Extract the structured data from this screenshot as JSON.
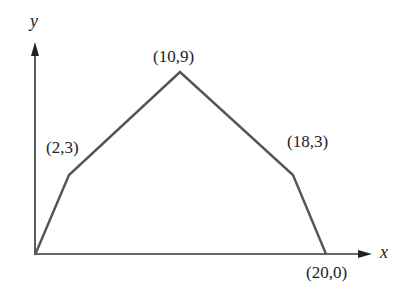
{
  "diagram": {
    "type": "polygonal-path",
    "axes": {
      "x_label": "x",
      "y_label": "y"
    },
    "points": [
      {
        "label": "(0,0)",
        "x": 0,
        "y": 0,
        "labeled": false
      },
      {
        "label": "(2,3)",
        "x": 2,
        "y": 3,
        "labeled": true
      },
      {
        "label": "(10,9)",
        "x": 10,
        "y": 9,
        "labeled": true
      },
      {
        "label": "(18,3)",
        "x": 18,
        "y": 3,
        "labeled": true
      },
      {
        "label": "(20,0)",
        "x": 20,
        "y": 0,
        "labeled": true
      }
    ],
    "labels": {
      "p1": "(2,3)",
      "p2": "(10,9)",
      "p3": "(18,3)",
      "p4": "(20,0)"
    },
    "colors": {
      "path": "#555555",
      "axes": "#333333",
      "text": "#222222"
    }
  }
}
